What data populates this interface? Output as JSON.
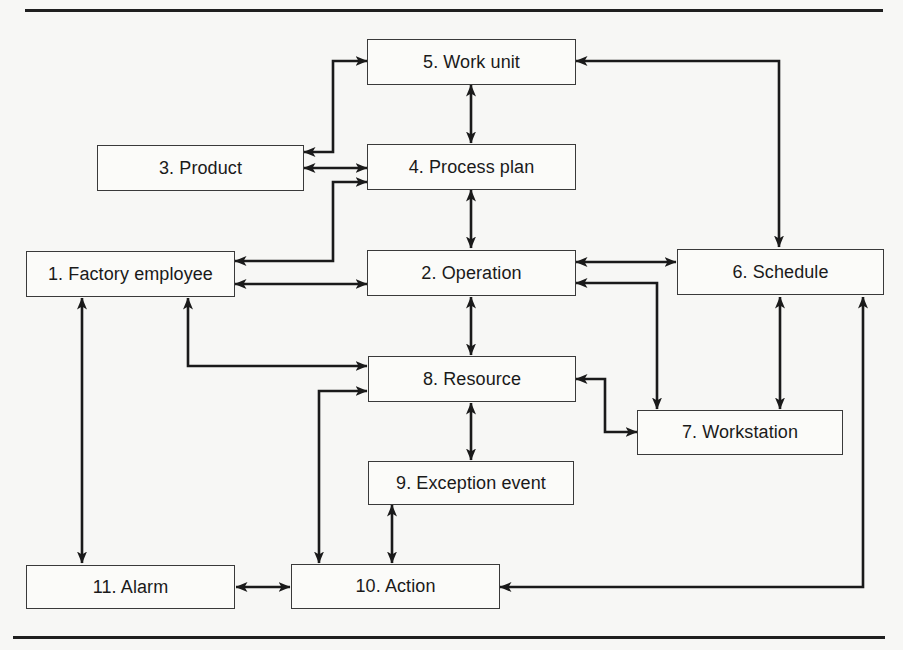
{
  "diagram": {
    "type": "entity-relationship",
    "nodes": [
      {
        "id": 1,
        "label": "1. Factory employee"
      },
      {
        "id": 2,
        "label": "2. Operation"
      },
      {
        "id": 3,
        "label": "3. Product"
      },
      {
        "id": 4,
        "label": "4. Process plan"
      },
      {
        "id": 5,
        "label": "5. Work unit"
      },
      {
        "id": 6,
        "label": "6. Schedule"
      },
      {
        "id": 7,
        "label": "7. Workstation"
      },
      {
        "id": 8,
        "label": "8. Resource"
      },
      {
        "id": 9,
        "label": "9. Exception event"
      },
      {
        "id": 10,
        "label": "10. Action"
      },
      {
        "id": 11,
        "label": "11. Alarm"
      }
    ],
    "edges": [
      {
        "from": 3,
        "to": 5,
        "direction": "both"
      },
      {
        "from": 3,
        "to": 4,
        "direction": "both"
      },
      {
        "from": 5,
        "to": 4,
        "direction": "both"
      },
      {
        "from": 5,
        "to": 6,
        "direction": "both"
      },
      {
        "from": 1,
        "to": 4,
        "direction": "both"
      },
      {
        "from": 4,
        "to": 2,
        "direction": "both"
      },
      {
        "from": 1,
        "to": 2,
        "direction": "both"
      },
      {
        "from": 2,
        "to": 6,
        "direction": "both"
      },
      {
        "from": 2,
        "to": 7,
        "direction": "both"
      },
      {
        "from": 2,
        "to": 8,
        "direction": "both"
      },
      {
        "from": 1,
        "to": 8,
        "direction": "both"
      },
      {
        "from": 6,
        "to": 7,
        "direction": "both"
      },
      {
        "from": 8,
        "to": 7,
        "direction": "both"
      },
      {
        "from": 8,
        "to": 9,
        "direction": "both"
      },
      {
        "from": 8,
        "to": 10,
        "direction": "both"
      },
      {
        "from": 9,
        "to": 10,
        "direction": "both"
      },
      {
        "from": 1,
        "to": 11,
        "direction": "both"
      },
      {
        "from": 11,
        "to": 10,
        "direction": "both"
      },
      {
        "from": 6,
        "to": 10,
        "direction": "both"
      }
    ]
  }
}
